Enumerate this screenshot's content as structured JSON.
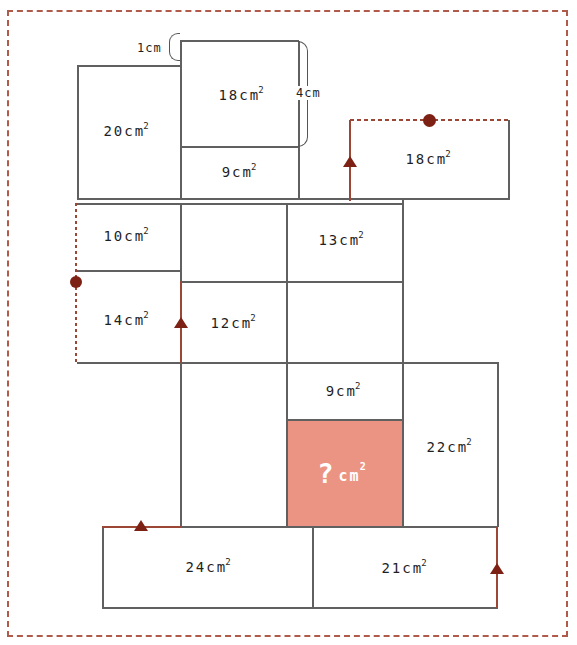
{
  "diagram": {
    "type": "area-puzzle"
  },
  "colors": {
    "background": "#ffffff",
    "frame_border": "#b05a49",
    "grid_line": "#606060",
    "path_red": "#9c4736",
    "marker_red": "#7d2114",
    "highlight_fill": "#ec9484",
    "label_text": "#1f1f1f",
    "unknown_text": "#ffffff"
  },
  "measurements": {
    "one_cm": "1cm",
    "four_cm": "4cm"
  },
  "regions": {
    "r20": {
      "text": "20cm",
      "sup": "2"
    },
    "r18_top": {
      "text": "18cm",
      "sup": "2"
    },
    "r9_top": {
      "text": "9cm",
      "sup": "2"
    },
    "r18_right": {
      "text": "18cm",
      "sup": "2"
    },
    "r10": {
      "text": "10cm",
      "sup": "2"
    },
    "r13": {
      "text": "13cm",
      "sup": "2"
    },
    "r14": {
      "text": "14cm",
      "sup": "2"
    },
    "r12": {
      "text": "12cm",
      "sup": "2"
    },
    "r9_mid": {
      "text": "9cm",
      "sup": "2"
    },
    "r22": {
      "text": "22cm",
      "sup": "2"
    },
    "r24": {
      "text": "24cm",
      "sup": "2"
    },
    "r21": {
      "text": "21cm",
      "sup": "2"
    },
    "unknown": {
      "q": "?",
      "text": "cm",
      "sup": "2"
    }
  }
}
